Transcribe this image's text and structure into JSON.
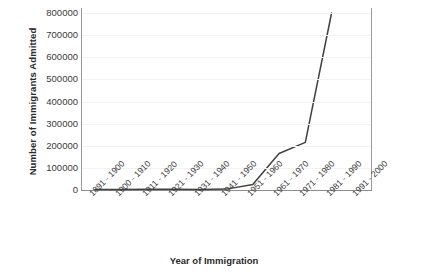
{
  "chart_data": {
    "type": "line",
    "title": "",
    "xlabel": "Year of Immigration",
    "ylabel": "Number of Immigrants Admitted",
    "categories": [
      "1891 - 1900",
      "1900 - 1910",
      "1911 - 1920",
      "1921 - 1930",
      "1931 - 1940",
      "1941 - 1950",
      "1951 - 1960",
      "1961 - 1970",
      "1971 - 1980",
      "1981 - 1990",
      "1991 - 2000"
    ],
    "values": [
      2000,
      2500,
      3000,
      3500,
      2000,
      4000,
      25000,
      165000,
      215000,
      800000,
      null
    ],
    "series": [
      {
        "name": "Number of Immigrants Admitted",
        "values": [
          2000,
          2500,
          3000,
          3500,
          2000,
          4000,
          25000,
          165000,
          215000,
          800000,
          null
        ]
      }
    ],
    "yticks": [
      0,
      100000,
      200000,
      300000,
      400000,
      500000,
      600000,
      700000,
      800000
    ],
    "ytick_labels": [
      "0",
      "100000",
      "200000",
      "300000",
      "400000",
      "500000",
      "600000",
      "700000",
      "800000"
    ],
    "ylim": [
      0,
      800000
    ],
    "grid": true,
    "legend": false,
    "line_color": "#404040"
  }
}
